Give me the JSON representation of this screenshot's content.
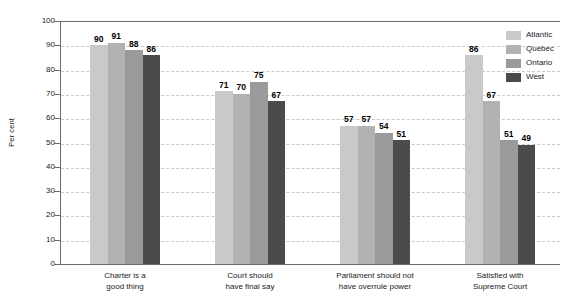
{
  "chart_data": {
    "type": "bar",
    "title": "",
    "subtitle": "",
    "xlabel": "",
    "ylabel": "Per cent",
    "ylim": [
      0,
      100
    ],
    "ytick_step": 10,
    "ytick_labels": [
      "100",
      "90",
      "80",
      "70",
      "60",
      "50",
      "40",
      "30",
      "20",
      "10",
      "0"
    ],
    "grid": true,
    "grid_style": "dashed-horizontal",
    "legend_position": "top-right",
    "orientation": "vertical",
    "grouping": "clustered",
    "categories": [
      "Charter is a\ngood thing",
      "Court should\nhave final say",
      "Parliament should not\nhave overrule power",
      "Satisfied with\nSupreme Court"
    ],
    "category_lines": [
      [
        "Charter is a",
        "good thing"
      ],
      [
        "Court should",
        "have final say"
      ],
      [
        "Parliament should not",
        "have overrule power"
      ],
      [
        "Satisfied with",
        "Supreme Court"
      ]
    ],
    "series": [
      {
        "name": "Atlantic",
        "color": "#c9c9c9",
        "values": [
          90,
          71,
          57,
          86
        ]
      },
      {
        "name": "Quebec",
        "color": "#b2b2b2",
        "values": [
          91,
          70,
          57,
          67
        ]
      },
      {
        "name": "Ontario",
        "color": "#9a9a9a",
        "values": [
          88,
          75,
          54,
          51
        ]
      },
      {
        "name": "West",
        "color": "#4b4b4b",
        "values": [
          86,
          67,
          51,
          49
        ]
      }
    ]
  },
  "legend": {
    "items": [
      {
        "label": "Atlantic"
      },
      {
        "label": "Quebec"
      },
      {
        "label": "Ontario"
      },
      {
        "label": "West"
      }
    ]
  }
}
